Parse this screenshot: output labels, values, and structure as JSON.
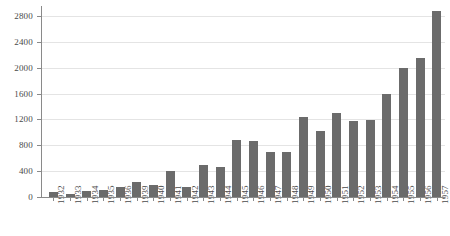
{
  "chart_data": {
    "type": "bar",
    "title": "",
    "subtitle": "",
    "xlabel": "",
    "ylabel": "",
    "grid": true,
    "legend": null,
    "bar_color": "#6b6b6b",
    "axis_color": "#8a8a8a",
    "gridline_color": "#e4e4e4",
    "background_color": "#ffffff",
    "ylim": [
      0,
      2900
    ],
    "yticks": [
      0,
      400,
      800,
      1200,
      1600,
      2000,
      2400,
      2800
    ],
    "ytick_labels": [
      "0",
      "400",
      "800",
      "1200",
      "1600",
      "2000",
      "2400",
      "2800"
    ],
    "categories": [
      "1932",
      "1933",
      "1934",
      "1935",
      "1936",
      "1939",
      "1940",
      "1941",
      "1942",
      "1943",
      "1944",
      "1945",
      "1946",
      "1947",
      "1948",
      "1949",
      "1950",
      "1951",
      "1952",
      "1953",
      "1954",
      "1955",
      "1956",
      "1957"
    ],
    "values": [
      70,
      50,
      95,
      105,
      160,
      225,
      185,
      400,
      155,
      500,
      470,
      880,
      860,
      690,
      700,
      1230,
      1020,
      1300,
      1180,
      1190,
      1600,
      2000,
      2150,
      2880
    ]
  }
}
